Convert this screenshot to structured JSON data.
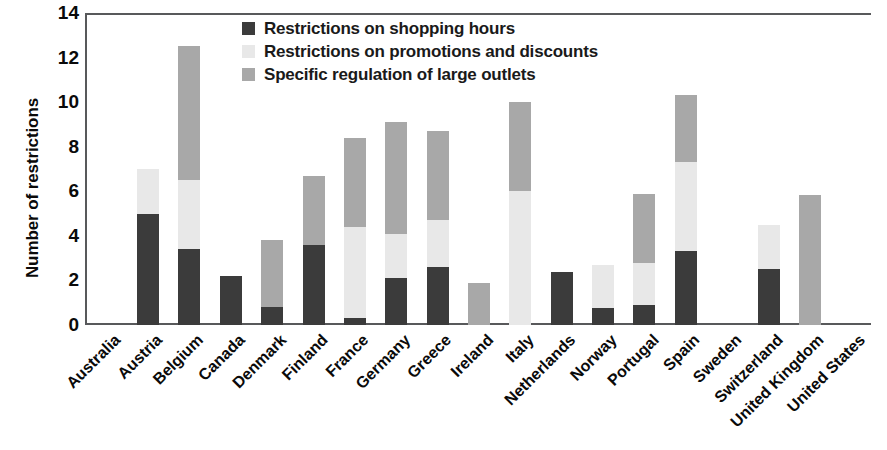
{
  "chart_data": {
    "type": "bar",
    "stacked": true,
    "title": "",
    "xlabel": "",
    "ylabel": "Number of restrictions",
    "ylim": [
      0,
      14
    ],
    "ytick_values": [
      0,
      2,
      4,
      6,
      8,
      10,
      12,
      14
    ],
    "ytick_labels": [
      "0",
      "2",
      "4",
      "6",
      "8",
      "10",
      "12",
      "14"
    ],
    "grid": false,
    "legend_position": "top-center",
    "categories": [
      "Australia",
      "Austria",
      "Belgium",
      "Canada",
      "Denmark",
      "Finland",
      "France",
      "Germany",
      "Greece",
      "Ireland",
      "Italy",
      "Netherlands",
      "Norway",
      "Portugal",
      "Spain",
      "Sweden",
      "Switzerland",
      "United Kingdom",
      "United States"
    ],
    "series": [
      {
        "name": "Restrictions on shopping hours",
        "color": "#3b3b3b",
        "values": [
          0,
          5.0,
          3.4,
          2.2,
          0.8,
          3.6,
          0.3,
          2.1,
          2.6,
          0,
          0,
          2.4,
          0.75,
          0.9,
          3.3,
          0,
          2.5,
          0,
          0
        ]
      },
      {
        "name": "Restrictions on promotions and discounts",
        "color": "#e8e8e8",
        "values": [
          0,
          2.0,
          3.1,
          0,
          0,
          0,
          4.1,
          2.0,
          2.1,
          0,
          6.0,
          0,
          1.95,
          1.9,
          4.0,
          0,
          2.0,
          0,
          0
        ]
      },
      {
        "name": "Specific regulation of large outlets",
        "color": "#a8a8a8",
        "values": [
          0,
          0,
          6.0,
          0,
          3.0,
          3.1,
          4.0,
          5.0,
          4.0,
          1.9,
          4.0,
          0,
          0,
          3.1,
          3.0,
          0,
          0,
          5.85,
          0
        ]
      }
    ],
    "totals": [
      0,
      7.0,
      12.5,
      2.2,
      3.8,
      6.7,
      8.4,
      9.1,
      8.7,
      1.9,
      10.0,
      2.4,
      2.7,
      5.9,
      10.3,
      0,
      4.5,
      5.85,
      0
    ]
  },
  "legend": {
    "items": [
      {
        "label": "Restrictions on shopping hours",
        "color": "#3b3b3b",
        "swatch_name": "legend-swatch-shopping-hours"
      },
      {
        "label": "Restrictions on promotions and discounts",
        "color": "#e8e8e8",
        "swatch_name": "legend-swatch-promotions-discounts"
      },
      {
        "label": "Specific regulation of large outlets",
        "color": "#a8a8a8",
        "swatch_name": "legend-swatch-large-outlets"
      }
    ]
  }
}
